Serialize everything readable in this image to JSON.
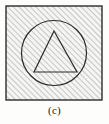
{
  "figure": {
    "label": "(c)",
    "colors": {
      "page_background": "#fdfdfc",
      "square_fill": "#f5f5f3",
      "hatch_line": "#8c8c8c",
      "outline": "#2b2b2b",
      "caption_text": "#1a1a1a"
    },
    "shapes": {
      "square": {
        "name": "outer-square",
        "x": 6,
        "y": 6,
        "width": 96,
        "height": 94,
        "stroke_width": 1.4,
        "filled": true,
        "hatched": true
      },
      "circle": {
        "name": "inner-circle",
        "cx": 54,
        "cy": 53,
        "r": 32.5,
        "stroke_width": 1.2,
        "filled": false,
        "hatched": false
      },
      "triangle": {
        "name": "inscribed-triangle",
        "points": "54,31 77,72 34,72",
        "apex": [
          54,
          31
        ],
        "base_right": [
          77,
          72
        ],
        "base_left": [
          34,
          72
        ],
        "stroke_width": 1.2,
        "filled": false,
        "hatched": false
      }
    },
    "hatch": {
      "name": "diagonal-hatch",
      "angle_degrees": 45,
      "direction": "lower-left-to-upper-right",
      "spacing_px": 4,
      "line_width": 0.9
    }
  }
}
